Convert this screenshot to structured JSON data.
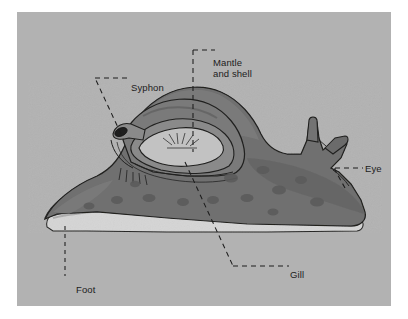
{
  "figure": {
    "kind": "anatomical-diagram",
    "panel_background_color": "#b2b2b2",
    "page_background_color": "#ffffff",
    "ink_color": "#1c1c1c"
  },
  "palette": {
    "body_fill": "#6e6e6e",
    "body_shadow": "#5a5a5a",
    "body_highlight": "#7d7d7d",
    "mantle_fill": "#747474",
    "mantle_dark": "#5f5f5f",
    "cavity_fill": "#bdbdbd",
    "cavity_rim": "#8e8e8e",
    "foot_fill": "#d3d3d3",
    "foot_shade": "#9a9a9a",
    "spot_fill": "#5c5c5c",
    "outline": "#20201f"
  },
  "labels": [
    {
      "id": "mantle",
      "text": "Mantle\nand shell",
      "line1": "Mantle",
      "line2": "and shell"
    },
    {
      "id": "syphon",
      "text": "Syphon"
    },
    {
      "id": "eye",
      "text": "Eye"
    },
    {
      "id": "gill",
      "text": "Gill"
    },
    {
      "id": "foot",
      "text": "Foot"
    }
  ],
  "label_text": {
    "mantle_line1": "Mantle",
    "mantle_line2": "and shell",
    "syphon": "Syphon",
    "eye": "Eye",
    "gill": "Gill",
    "foot": "Foot"
  }
}
